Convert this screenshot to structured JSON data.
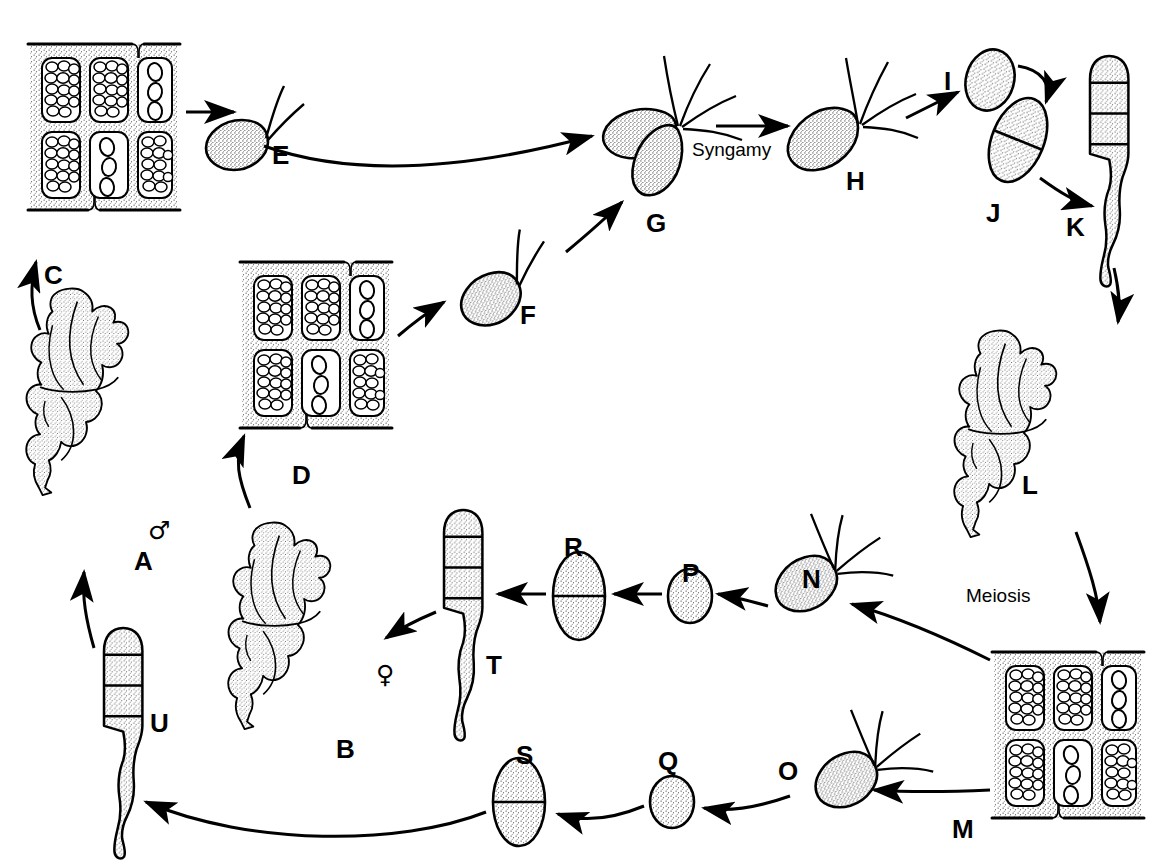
{
  "figure": {
    "background_color": "#ffffff",
    "ink_color": "#000000",
    "stipple_color": "#3a3a3a",
    "width": 1164,
    "height": 862
  },
  "process_labels": [
    {
      "id": "syngamy",
      "text": "Syngamy",
      "x": 692,
      "y": 140
    },
    {
      "id": "meiosis",
      "text": "Meiosis",
      "x": 966,
      "y": 586
    }
  ],
  "gender_symbols": [
    {
      "id": "male",
      "glyph": "♂",
      "belongs_to": "A",
      "x": 148,
      "y": 518
    },
    {
      "id": "female",
      "glyph": "♀",
      "belongs_to": "B",
      "x": 376,
      "y": 662
    }
  ],
  "stage_labels": [
    {
      "id": "A",
      "text": "A",
      "x": 134,
      "y": 548,
      "describes": "male-gametophyte-thallus"
    },
    {
      "id": "B",
      "text": "B",
      "x": 336,
      "y": 736,
      "describes": "female-gametophyte-thallus"
    },
    {
      "id": "C",
      "text": "C",
      "x": 44,
      "y": 262,
      "describes": "male-gametangium-sorus"
    },
    {
      "id": "D",
      "text": "D",
      "x": 292,
      "y": 462,
      "describes": "female-gametangium-sorus"
    },
    {
      "id": "E",
      "text": "E",
      "x": 272,
      "y": 142,
      "describes": "male-gamete-biflagellate"
    },
    {
      "id": "F",
      "text": "F",
      "x": 520,
      "y": 302,
      "describes": "female-gamete-biflagellate"
    },
    {
      "id": "G",
      "text": "G",
      "x": 646,
      "y": 210,
      "describes": "fusing-gametes-pair"
    },
    {
      "id": "H",
      "text": "H",
      "x": 846,
      "y": 168,
      "describes": "quadriflagellate-zygote"
    },
    {
      "id": "I",
      "text": "I",
      "x": 944,
      "y": 68,
      "describes": "settled-zygote"
    },
    {
      "id": "J",
      "text": "J",
      "x": 986,
      "y": 200,
      "describes": "two-celled-sporeling"
    },
    {
      "id": "K",
      "text": "K",
      "x": 1066,
      "y": 214,
      "describes": "young-sporophyte-germling"
    },
    {
      "id": "L",
      "text": "L",
      "x": 1022,
      "y": 472,
      "describes": "mature-sporophyte-thallus"
    },
    {
      "id": "M",
      "text": "M",
      "x": 952,
      "y": 816,
      "describes": "sporangium-sorus"
    },
    {
      "id": "N",
      "text": "N",
      "x": 802,
      "y": 566,
      "describes": "quadriflagellate-zoospore-upper"
    },
    {
      "id": "O",
      "text": "O",
      "x": 778,
      "y": 758,
      "describes": "quadriflagellate-zoospore-lower"
    },
    {
      "id": "P",
      "text": "P",
      "x": 682,
      "y": 560,
      "describes": "settled-spore-upper"
    },
    {
      "id": "Q",
      "text": "Q",
      "x": 658,
      "y": 748,
      "describes": "settled-spore-lower"
    },
    {
      "id": "R",
      "text": "R",
      "x": 564,
      "y": 534,
      "describes": "two-celled-germling-upper"
    },
    {
      "id": "S",
      "text": "S",
      "x": 516,
      "y": 742,
      "describes": "two-celled-germling-lower"
    },
    {
      "id": "T",
      "text": "T",
      "x": 486,
      "y": 652,
      "describes": "female-germling"
    },
    {
      "id": "U",
      "text": "U",
      "x": 150,
      "y": 710,
      "describes": "male-germling"
    }
  ],
  "flow": {
    "description": "Haploid gametophytes A and B form gametangia C and D releasing gametes E and F, which fuse (Syngamy) at G into zygote H, settling as I, dividing to J, growing to germling K and sporophyte L. Sporangia M undergo Meiosis producing zoospores N and O, which settle as P and Q, divide to R and S, grow into germlings T and U, and regenerate gametophytes B and A.",
    "steps": [
      {
        "from": "A",
        "to": "C",
        "kind": "straight-arrow"
      },
      {
        "from": "C",
        "to": "E",
        "kind": "straight-arrow"
      },
      {
        "from": "E",
        "to": "G",
        "kind": "curved-arrow"
      },
      {
        "from": "B",
        "to": "D",
        "kind": "straight-arrow"
      },
      {
        "from": "D",
        "to": "F",
        "kind": "straight-arrow"
      },
      {
        "from": "F",
        "to": "G",
        "kind": "straight-arrow"
      },
      {
        "from": "G",
        "to": "H",
        "kind": "straight-arrow",
        "label": "Syngamy"
      },
      {
        "from": "H",
        "to": "I",
        "kind": "curved-arrow"
      },
      {
        "from": "I",
        "to": "J",
        "kind": "curved-arrow"
      },
      {
        "from": "J",
        "to": "K",
        "kind": "curved-arrow"
      },
      {
        "from": "K",
        "to": "L",
        "kind": "curved-arrow"
      },
      {
        "from": "L",
        "to": "M",
        "kind": "curved-arrow",
        "label": "Meiosis"
      },
      {
        "from": "M",
        "to": "N",
        "kind": "straight-arrow"
      },
      {
        "from": "M",
        "to": "O",
        "kind": "straight-arrow"
      },
      {
        "from": "N",
        "to": "P",
        "kind": "straight-arrow"
      },
      {
        "from": "P",
        "to": "R",
        "kind": "straight-arrow"
      },
      {
        "from": "R",
        "to": "T",
        "kind": "straight-arrow"
      },
      {
        "from": "T",
        "to": "B",
        "kind": "straight-arrow"
      },
      {
        "from": "O",
        "to": "Q",
        "kind": "curved-arrow"
      },
      {
        "from": "Q",
        "to": "S",
        "kind": "curved-arrow"
      },
      {
        "from": "S",
        "to": "U",
        "kind": "curved-arrow"
      },
      {
        "from": "U",
        "to": "A",
        "kind": "curved-arrow"
      }
    ]
  },
  "structures": {
    "sorus_cells": {
      "rows": 2,
      "cols": 3,
      "filled_cells": 4,
      "empty_cells": 2,
      "note": "cells packed with gametes/spores; two cells show 3 large discharged bodies"
    },
    "gamete": {
      "flagella": 2,
      "shape": "pyriform"
    },
    "zoospore": {
      "flagella": 4,
      "shape": "pyriform"
    },
    "germling": {
      "segments": 4,
      "has_rhizoid": true
    }
  }
}
